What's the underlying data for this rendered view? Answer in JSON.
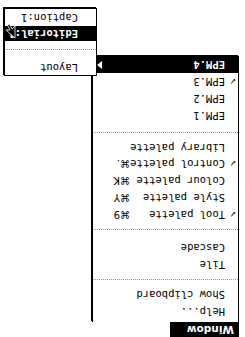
{
  "menu_bar": {
    "title": "Window"
  },
  "menu": {
    "items": [
      {
        "label": "Help...",
        "checked": false,
        "shortcut": ""
      },
      {
        "label": "Show clipboard",
        "checked": false,
        "shortcut": ""
      },
      {
        "label": "Tile",
        "checked": false,
        "shortcut": ""
      },
      {
        "label": "Cascade",
        "checked": false,
        "shortcut": ""
      },
      {
        "label": "Tool palette",
        "checked": true,
        "check_glyph": "✓",
        "shortcut": "⌘9"
      },
      {
        "label": "Style palette",
        "checked": false,
        "shortcut": "⌘Y"
      },
      {
        "label": "Colour palette",
        "checked": false,
        "shortcut": "⌘K"
      },
      {
        "label": "Control palette",
        "checked": true,
        "check_glyph": "✓",
        "shortcut": "⌘."
      },
      {
        "label": "Library palette",
        "checked": false,
        "shortcut": ""
      },
      {
        "label": "EPM.1",
        "checked": false,
        "shortcut": ""
      },
      {
        "label": "EPM.2",
        "checked": false,
        "shortcut": ""
      },
      {
        "label": "EPM.3",
        "checked": true,
        "check_glyph": "✓",
        "shortcut": ""
      },
      {
        "label": "EPM.4",
        "checked": false,
        "highlighted": true,
        "has_submenu": true,
        "shortcut": ""
      }
    ]
  },
  "submenu": {
    "items": [
      {
        "label": "Layout",
        "highlighted": false
      },
      {
        "label": "Editorial:1",
        "highlighted": true
      },
      {
        "label": "Caption:1",
        "highlighted": false
      }
    ]
  },
  "colors": {
    "highlight": "#000000",
    "background": "#ffffff",
    "separator": "#9a9a9a"
  },
  "orientation": "rotated 180 degrees"
}
